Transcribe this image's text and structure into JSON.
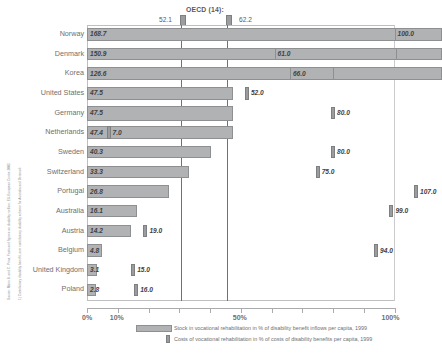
{
  "notes": {
    "source": "Source: Marin B. and C. Prinz, Facts and figures on disability welfare, EU-European Centre 2003",
    "footnote": "1) Contributory disability benefit, own contributory disability scheme for Australia and Denmark"
  },
  "oecd": {
    "title": "OECD (14):",
    "stock_average": "52.1",
    "costs_average": "62.2"
  },
  "axis": {
    "tick_labels": [
      "0%",
      "10%",
      "50%",
      "100%"
    ],
    "tick_values": [
      0,
      10,
      50,
      100
    ]
  },
  "legend": {
    "items": [
      "Stock in vocational rehabilitation in % of disability benefit inflows per capita, 1999",
      "Costs of vocational rehabilitation in % of costs of disability benefits per capita, 1999"
    ]
  },
  "chart_data": {
    "type": "bar",
    "orientation": "horizontal",
    "title": "",
    "xlabel": "",
    "ylabel": "",
    "xlim": [
      0,
      118
    ],
    "grid": false,
    "legend_position": "bottom",
    "categories": [
      "Norway",
      "Denmark",
      "Korea",
      "United States",
      "Germany",
      "Netherlands",
      "Sweden",
      "Switzerland",
      "Portugal",
      "Australia",
      "Austria",
      "Belgium",
      "United Kingdom",
      "Poland"
    ],
    "series": [
      {
        "name": "Stock in vocational rehabilitation in % of disability benefit inflows per capita, 1999",
        "values": [
          168.7,
          150.9,
          126.6,
          47.5,
          47.5,
          47.4,
          40.3,
          33.3,
          26.8,
          16.1,
          14.2,
          4.8,
          3.1,
          2.8
        ],
        "labels": [
          "168.7",
          "150.9",
          "126.6",
          "47.5",
          "47.5",
          "47.4",
          "40.3",
          "33.3",
          "26.8",
          "16.1",
          "14.2",
          "4.8",
          "3.1",
          "2.8"
        ]
      },
      {
        "name": "Costs of vocational rehabilitation in % of costs of disability benefits per capita, 1999",
        "values": [
          100.0,
          61.0,
          66.0,
          52.0,
          80.0,
          7.0,
          80.0,
          75.0,
          107.0,
          99.0,
          19.0,
          94.0,
          15.0,
          16.0
        ],
        "labels": [
          "100.0",
          "61.0",
          "66.0",
          "52.0",
          "80.0",
          "7.0",
          "80.0",
          "75.0",
          "107.0",
          "99.0",
          "19.0",
          "94.0",
          "15.0",
          "16.0"
        ]
      }
    ],
    "reference_lines": [
      {
        "label": "OECD (14) stock average",
        "value": 52.1
      },
      {
        "label": "OECD (14) costs average",
        "value": 62.2
      }
    ]
  }
}
